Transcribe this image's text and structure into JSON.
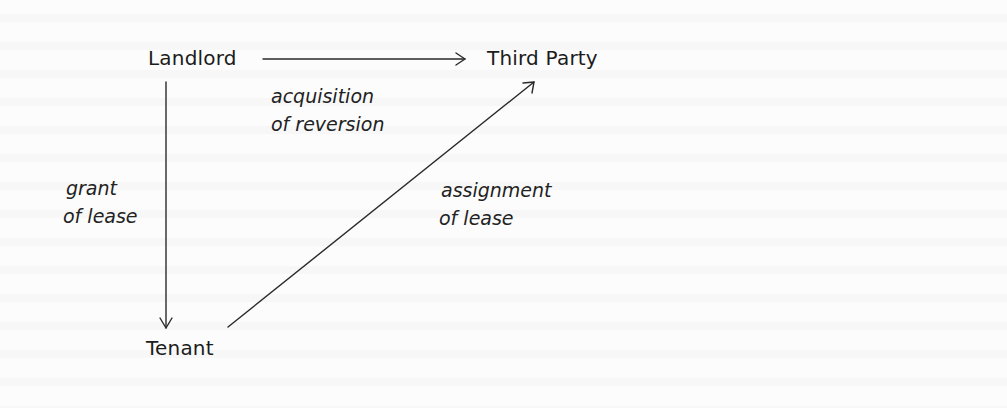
{
  "diagram": {
    "nodes": {
      "landlord": "Landlord",
      "third_party": "Third Party",
      "tenant": "Tenant"
    },
    "edges": {
      "acquisition": {
        "from": "Landlord",
        "to": "Third Party",
        "line1": "acquisition",
        "line2": "of reversion"
      },
      "grant": {
        "from": "Landlord",
        "to": "Tenant",
        "line1": "grant",
        "line2": "of lease"
      },
      "assignment": {
        "from": "Tenant",
        "to": "Third Party",
        "line1": "assignment",
        "line2": "of lease"
      }
    },
    "colors": {
      "ink": "#1c1c1c",
      "background": "#fcfcfc"
    }
  }
}
